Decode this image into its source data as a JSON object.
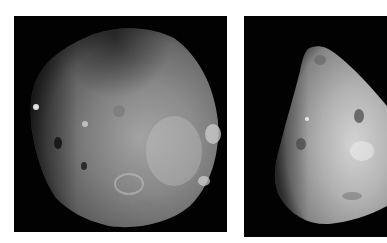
{
  "images": [
    {
      "id": "left",
      "subject": "Phobos",
      "description": "Grayscale photo of a heavily cratered, lumpy irregular moon on black background",
      "background": "#020202",
      "surface_tone": "#8e8e8e"
    },
    {
      "id": "right",
      "subject": "Deimos",
      "description": "Grayscale photo of a smooth, triangular-shaped moon with few craters on black background, cropped at right edge",
      "background": "#020202",
      "surface_tone": "#b4b4b4"
    }
  ],
  "page_background": "#ffffff"
}
